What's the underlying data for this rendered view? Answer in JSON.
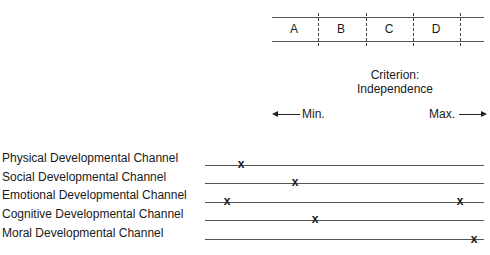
{
  "scale": {
    "segments": [
      {
        "label": "A"
      },
      {
        "label": "B"
      },
      {
        "label": "C"
      },
      {
        "label": "D"
      }
    ]
  },
  "criterion": {
    "line1": "Criterion:",
    "line2": "Independence"
  },
  "axis": {
    "min_label": "Min.",
    "max_label": "Max."
  },
  "channels": [
    {
      "label": "Physical Developmental Channel",
      "marks": [
        "x"
      ]
    },
    {
      "label": "Social Developmental Channel",
      "marks": [
        "x"
      ]
    },
    {
      "label": "Emotional Developmental Channel",
      "marks": [
        "x",
        "x"
      ]
    },
    {
      "label": "Cognitive Developmental Channel",
      "marks": [
        "x"
      ]
    },
    {
      "label": "Moral Developmental Channel",
      "marks": [
        "x"
      ]
    }
  ]
}
